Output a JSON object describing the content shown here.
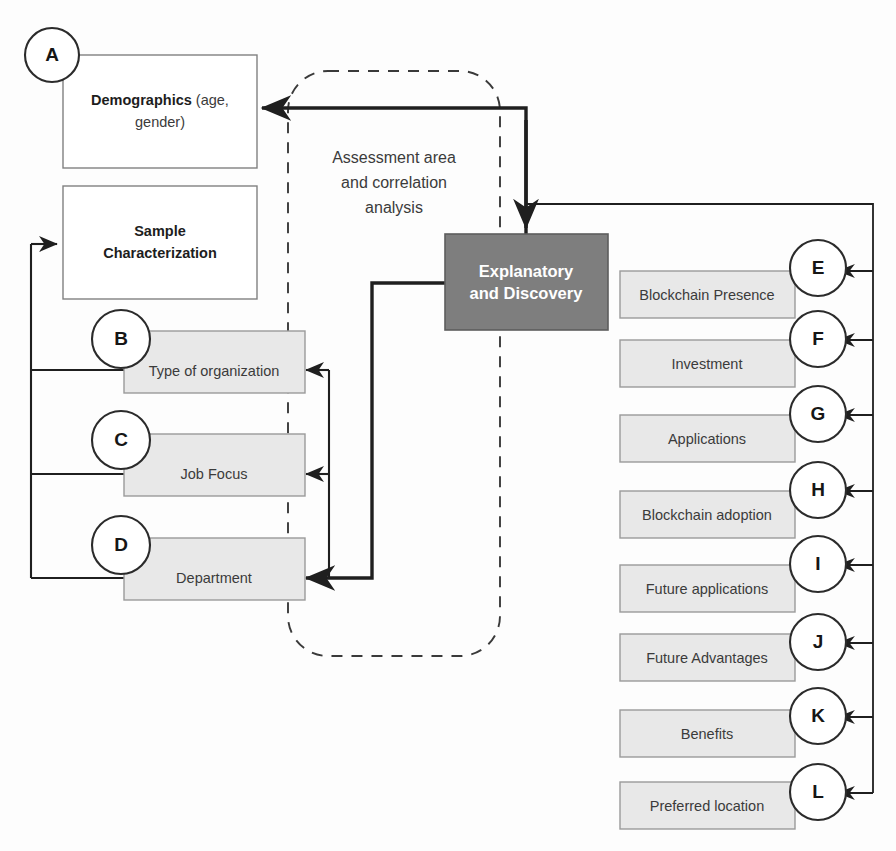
{
  "diagram": {
    "title": "Assessment area and correlation analysis",
    "colors": {
      "shaded_box_fill": "#e8e8e8",
      "dark_box_fill": "#7e7e7e",
      "line": "#1f1f1f",
      "box_stroke": "#808080",
      "dashed_stroke": "#3a3a3a"
    },
    "group_label": {
      "lines": [
        "Assessment area",
        "and correlation",
        "analysis"
      ]
    },
    "center_node": {
      "badge": "",
      "lines": [
        "Explanatory",
        "and Discovery"
      ]
    },
    "left_nodes": [
      {
        "badge": "A",
        "label_bold": "Demographics",
        "label_rest": " (age,",
        "label_line2": "gender)",
        "shaded": false
      },
      {
        "badge": "",
        "label_bold": "Sample",
        "label_rest": "",
        "label_line2": "Characterization",
        "shaded": false
      },
      {
        "badge": "B",
        "label_bold": "",
        "label_rest": "Type of organization",
        "label_line2": "",
        "shaded": true
      },
      {
        "badge": "C",
        "label_bold": "",
        "label_rest": "Job Focus",
        "label_line2": "",
        "shaded": true
      },
      {
        "badge": "D",
        "label_bold": "",
        "label_rest": "Department",
        "label_line2": "",
        "shaded": true
      }
    ],
    "right_nodes": [
      {
        "badge": "E",
        "label": "Blockchain Presence"
      },
      {
        "badge": "F",
        "label": "Investment"
      },
      {
        "badge": "G",
        "label": "Applications"
      },
      {
        "badge": "H",
        "label": "Blockchain adoption"
      },
      {
        "badge": "I",
        "label": "Future applications"
      },
      {
        "badge": "J",
        "label": "Future Advantages"
      },
      {
        "badge": "K",
        "label": "Benefits"
      },
      {
        "badge": "L",
        "label": "Preferred location"
      }
    ]
  }
}
